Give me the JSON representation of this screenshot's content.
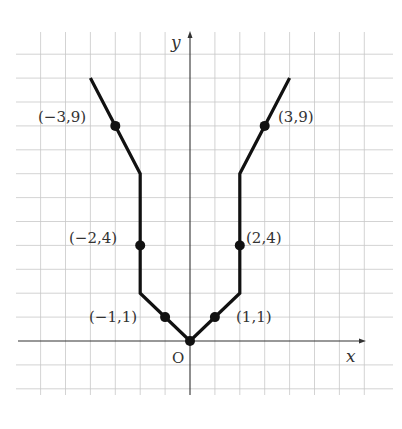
{
  "figure": {
    "x_axis_label": "x",
    "y_axis_label": "y",
    "origin_label": "O"
  },
  "chart_data": {
    "type": "line",
    "title": "",
    "xlabel": "x",
    "ylabel": "y",
    "grid": true,
    "xlim": [
      -6,
      7
    ],
    "ylim": [
      -2,
      12
    ],
    "polyline": [
      [
        -4,
        11
      ],
      [
        -2,
        7
      ],
      [
        -2,
        2
      ],
      [
        0,
        0
      ],
      [
        2,
        2
      ],
      [
        2,
        7
      ],
      [
        4,
        11
      ]
    ],
    "marked_points": [
      {
        "x": -3,
        "y": 9,
        "label": "(−3,9)"
      },
      {
        "x": -2,
        "y": 4,
        "label": "(−2,4)"
      },
      {
        "x": -1,
        "y": 1,
        "label": "(−1,1)"
      },
      {
        "x": 0,
        "y": 0,
        "label": "O"
      },
      {
        "x": 1,
        "y": 1,
        "label": "(1,1)"
      },
      {
        "x": 2,
        "y": 4,
        "label": "(2,4)"
      },
      {
        "x": 3,
        "y": 9,
        "label": "(3,9)"
      }
    ]
  },
  "labels": {
    "p_m3_9": "(−3,9)",
    "p_m2_4": "(−2,4)",
    "p_m1_1": "(−1,1)",
    "p_1_1": "(1,1)",
    "p_2_4": "(2,4)",
    "p_3_9": "(3,9)"
  }
}
